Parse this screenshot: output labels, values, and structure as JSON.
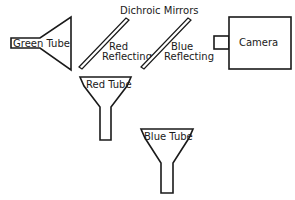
{
  "diagram": {
    "title": "Dichroic Mirrors",
    "components": {
      "green_tube": {
        "label": "Green Tube"
      },
      "red_tube": {
        "label": "Red Tube"
      },
      "blue_tube": {
        "label": "Blue Tube"
      },
      "camera": {
        "label": "Camera"
      },
      "red_mirror": {
        "label_line1": "Red",
        "label_line2": "Reflecting"
      },
      "blue_mirror": {
        "label_line1": "Blue",
        "label_line2": "Reflecting"
      }
    },
    "colors": {
      "line": "#1a1a1a",
      "background": "#ffffff"
    }
  }
}
